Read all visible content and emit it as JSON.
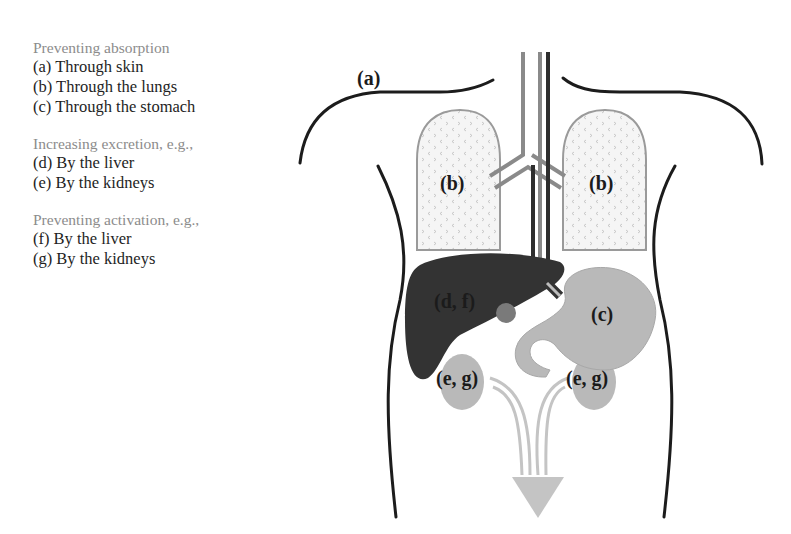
{
  "legend": {
    "groups": [
      {
        "heading": "Preventing absorption",
        "items": [
          "(a) Through skin",
          "(b) Through the lungs",
          "(c) Through the stomach"
        ]
      },
      {
        "heading": "Increasing excretion, e.g.,",
        "items": [
          "(d) By the liver",
          "(e) By the kidneys"
        ]
      },
      {
        "heading": "Preventing activation, e.g.,",
        "items": [
          "(f) By the liver",
          "(g) By the kidneys"
        ]
      }
    ]
  },
  "diagram": {
    "labels": {
      "skin": "(a)",
      "lung_left": "(b)",
      "lung_right": "(b)",
      "liver": "(d, f)",
      "stomach": "(c)",
      "kidney_left": "(e, g)",
      "kidney_right": "(e, g)"
    },
    "colors": {
      "outline": "#1c1c1c",
      "lung_fill": "#f4f4f4",
      "lung_border": "#9a9a9a",
      "trachea": "#8a8a8a",
      "esophagus_dark": "#2e2e2e",
      "liver": "#333333",
      "gallbladder": "#7a7a7a",
      "stomach": "#b9b9b9",
      "kidney": "#b9b9b9",
      "ureter": "#c4c4c4"
    }
  }
}
